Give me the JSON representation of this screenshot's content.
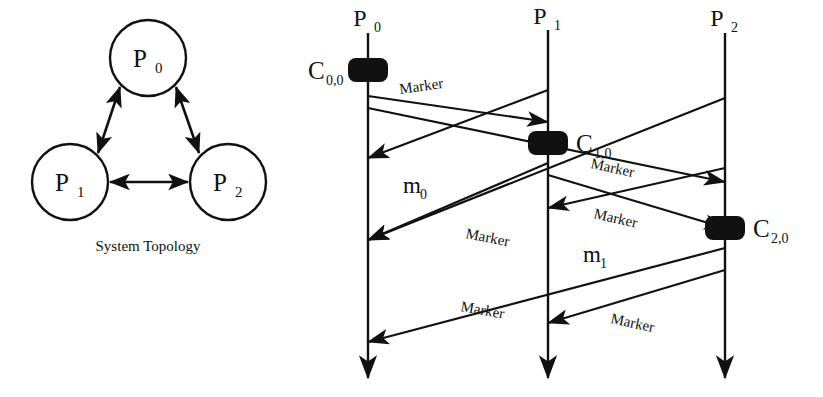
{
  "figure": {
    "stroke_color": "#111111",
    "background_color": "#ffffff"
  },
  "topology": {
    "caption": "System Topology",
    "nodes": [
      {
        "id": "p0",
        "label": "P",
        "sub": "0",
        "cx": 148,
        "cy": 58,
        "r": 38
      },
      {
        "id": "p1",
        "label": "P",
        "sub": "1",
        "cx": 70,
        "cy": 182,
        "r": 38
      },
      {
        "id": "p2",
        "label": "P",
        "sub": "2",
        "cx": 228,
        "cy": 182,
        "r": 38
      }
    ],
    "edges": [
      {
        "from": "p0",
        "to": "p1",
        "bidirectional": true
      },
      {
        "from": "p0",
        "to": "p2",
        "bidirectional": true
      },
      {
        "from": "p1",
        "to": "p2",
        "bidirectional": true
      }
    ]
  },
  "snapshot": {
    "lifelines": [
      {
        "id": "P0",
        "label": "P",
        "sub": "0",
        "x": 68,
        "y_top": 33,
        "y_bottom": 378
      },
      {
        "id": "P1",
        "label": "P",
        "sub": "1",
        "x": 248,
        "y_top": 30,
        "y_bottom": 378
      },
      {
        "id": "P2",
        "label": "P",
        "sub": "2",
        "x": 425,
        "y_top": 33,
        "y_bottom": 378
      }
    ],
    "checkpoints": [
      {
        "id": "C00",
        "label": "C",
        "sub": "0,0",
        "x": 68,
        "y": 70,
        "label_side": "left"
      },
      {
        "id": "C10",
        "label": "C",
        "sub": "1,0",
        "x": 248,
        "y": 143,
        "label_side": "right"
      },
      {
        "id": "C20",
        "label": "C",
        "sub": "2,0",
        "x": 425,
        "y": 228,
        "label_side": "right"
      }
    ],
    "messages": [
      {
        "id": "m-p0-p1-marker",
        "from": "P0",
        "to": "P1",
        "x1": 68,
        "y1": 96,
        "x2": 248,
        "y2": 122,
        "label": "Marker",
        "label_x": 100,
        "label_y": 94,
        "label_rot": -8
      },
      {
        "id": "m-p0-p2-marker",
        "from": "P0",
        "to": "P2",
        "x1": 68,
        "y1": 108,
        "x2": 425,
        "y2": 182,
        "label": "Marker",
        "label_x": 290,
        "label_y": 168,
        "label_rot": 12
      },
      {
        "id": "m-p1-p0-m0",
        "from": "P1",
        "to": "P0",
        "x1": 248,
        "y1": 90,
        "x2": 68,
        "y2": 158,
        "label": "m",
        "label_sub": "0",
        "label_x": 103,
        "label_y": 193,
        "label_rot": 0
      },
      {
        "id": "m-p2-p0-msg",
        "from": "P2",
        "to": "P0",
        "x1": 425,
        "y1": 98,
        "x2": 68,
        "y2": 240,
        "label": "",
        "label_x": 0,
        "label_y": 0,
        "label_rot": 0
      },
      {
        "id": "m-p1-p0-marker",
        "from": "P1",
        "to": "P0",
        "x1": 248,
        "y1": 163,
        "x2": 68,
        "y2": 240,
        "label": "Marker",
        "label_x": 165,
        "label_y": 238,
        "label_rot": 11
      },
      {
        "id": "m-p1-p2-marker",
        "from": "P1",
        "to": "P2",
        "x1": 248,
        "y1": 175,
        "x2": 425,
        "y2": 228,
        "label": "Marker",
        "label_x": 293,
        "label_y": 218,
        "label_rot": 13
      },
      {
        "id": "m-p2-p1-m1",
        "from": "P2",
        "to": "P1",
        "x1": 425,
        "y1": 168,
        "x2": 248,
        "y2": 208,
        "label": "m",
        "label_sub": "1",
        "label_x": 283,
        "label_y": 262,
        "label_rot": 0
      },
      {
        "id": "m-p2-p0-marker",
        "from": "P2",
        "to": "P0",
        "x1": 425,
        "y1": 248,
        "x2": 68,
        "y2": 342,
        "label": "Marker",
        "label_x": 160,
        "label_y": 311,
        "label_rot": 10
      },
      {
        "id": "m-p2-p1-marker",
        "from": "P2",
        "to": "P1",
        "x1": 425,
        "y1": 270,
        "x2": 248,
        "y2": 323,
        "label": "Marker",
        "label_x": 310,
        "label_y": 323,
        "label_rot": 12
      }
    ]
  }
}
